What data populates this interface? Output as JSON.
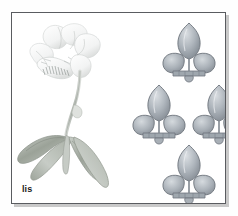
{
  "plate": {
    "caption": "lis",
    "background_color": "#fefefe",
    "panel_background": "#ffffff",
    "frame_color": "#5a5c60",
    "frame_shadow_color": "#c9c9c9",
    "caption_color": "#1b1b1b"
  },
  "illustration": {
    "name": "iris-plant-pencil-drawing",
    "subject": "lis",
    "description": "faint pencil drawing of an iris plant with a pale blossom at upper left, a slender curving stem, and long sword-shaped leaves fanning to the lower left",
    "parts": [
      {
        "name": "blossom",
        "label": "iris flower"
      },
      {
        "name": "stem",
        "label": "stem"
      },
      {
        "name": "leaves",
        "label": "sword-shaped leaves"
      }
    ],
    "ink_color": "#b9bdb9",
    "leaf_color": "#a9afa7",
    "petal_color": "#e2e4e4"
  },
  "fleurs": {
    "name": "fleur-de-lis-emblems",
    "count": 4,
    "arrangement": "diamond",
    "fill_light": "#cdd2d6",
    "fill_mid": "#a9b0b7",
    "fill_dark": "#8d949c",
    "outline": "#6e757d",
    "items": [
      {
        "label": "fleur-de-lis top",
        "position": "top",
        "x": 30,
        "y": 0,
        "scale": 1.0
      },
      {
        "label": "fleur-de-lis middle left",
        "position": "left",
        "x": 0,
        "y": 62,
        "scale": 1.0
      },
      {
        "label": "fleur-de-lis middle right",
        "position": "right",
        "x": 60,
        "y": 62,
        "scale": 1.0
      },
      {
        "label": "fleur-de-lis bottom",
        "position": "bottom",
        "x": 30,
        "y": 122,
        "scale": 1.0
      }
    ]
  }
}
